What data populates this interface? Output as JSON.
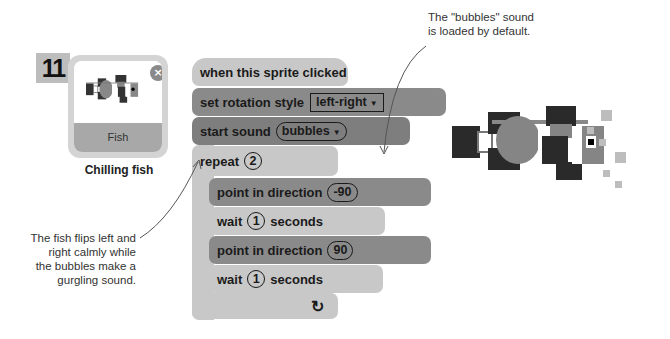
{
  "step": {
    "number": "11"
  },
  "sprite": {
    "name": "Fish",
    "caption": "Chilling fish",
    "close_icon": "×"
  },
  "annotations": {
    "top_right": "The \"bubbles\" sound is loaded by default.",
    "left": "The fish flips left and right calmly while the bubbles make a gurgling sound."
  },
  "script": {
    "hat": {
      "label": "when this sprite clicked"
    },
    "rotation": {
      "label": "set rotation style",
      "value": "left-right",
      "dropdown_arrow": "▼"
    },
    "sound": {
      "label": "start sound",
      "value": "bubbles",
      "dropdown_arrow": "▼"
    },
    "repeat": {
      "label": "repeat",
      "value": "2",
      "loop_icon": "↻"
    },
    "point1": {
      "label": "point in direction",
      "value": "-90"
    },
    "wait1": {
      "label": "wait",
      "value": "1",
      "suffix": "seconds"
    },
    "point2": {
      "label": "point in direction",
      "value": "90"
    },
    "wait2": {
      "label": "wait",
      "value": "1",
      "suffix": "seconds"
    }
  },
  "colors": {
    "light_block": "#c8c8c8",
    "dark_block": "#8a8a8a",
    "step_badge": "#bdbdbd"
  }
}
